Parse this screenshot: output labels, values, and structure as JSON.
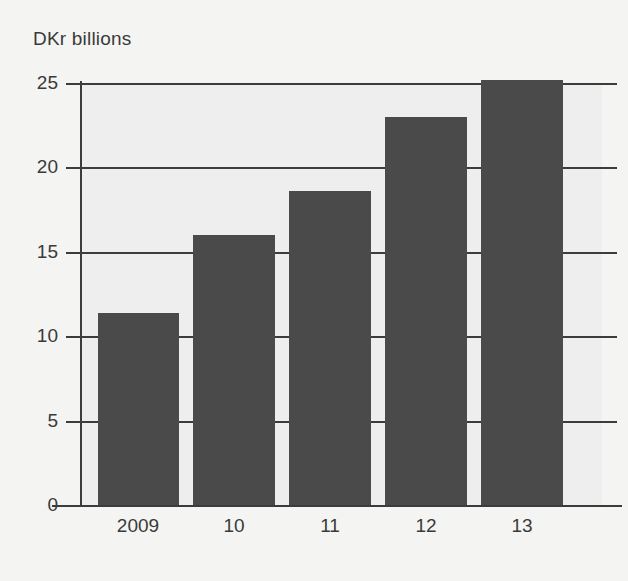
{
  "chart_data": {
    "type": "bar",
    "title": "DKr billions",
    "xlabel": "",
    "ylabel": "",
    "categories": [
      "2009",
      "10",
      "11",
      "12",
      "13"
    ],
    "values": [
      11.4,
      16.0,
      18.6,
      23.0,
      25.2
    ],
    "ylim": [
      0,
      25
    ],
    "yticks": [
      0,
      5,
      10,
      15,
      20,
      25
    ],
    "ytick_labels": [
      "0",
      "5",
      "10",
      "15",
      "20",
      "25"
    ],
    "grid": true,
    "legend": null,
    "series": [
      {
        "name": "DKr billions",
        "values": [
          11.4,
          16.0,
          18.6,
          23.0,
          25.2
        ]
      }
    ],
    "colors": {
      "bar": "#4a4a4a",
      "plot_background": "#eeeeee",
      "page_background": "#f4f4f2",
      "axis": "#3c3c3c",
      "text": "#3a3a3a"
    }
  }
}
